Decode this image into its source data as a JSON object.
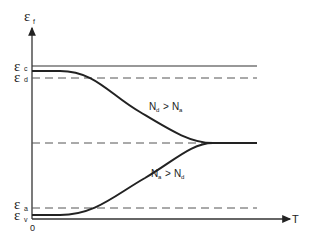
{
  "diagram": {
    "type": "energy-level-vs-temperature",
    "y_axis": {
      "symbol": "ε",
      "subscript": "f"
    },
    "x_axis": {
      "label": "T",
      "origin_label": "0"
    },
    "levels": [
      {
        "symbol": "ε",
        "subscript": "c",
        "style": "solid"
      },
      {
        "symbol": "ε",
        "subscript": "d",
        "style": "dashed"
      },
      {
        "symbol": "ε",
        "subscript": "a",
        "style": "dashed"
      },
      {
        "symbol": "ε",
        "subscript": "v",
        "style": "solid-curve-start"
      }
    ],
    "midgap_line": {
      "style": "dashed"
    },
    "curves": [
      {
        "name": "n-type",
        "label_main": "N",
        "label_sub1": "d",
        "relation": ">",
        "label_main2": "N",
        "label_sub2": "a"
      },
      {
        "name": "p-type",
        "label_main": "N",
        "label_sub1": "a",
        "relation": ">",
        "label_main2": "N",
        "label_sub2": "d"
      }
    ],
    "colors": {
      "line": "#222222",
      "dashed": "#555555",
      "background": "#ffffff"
    }
  }
}
